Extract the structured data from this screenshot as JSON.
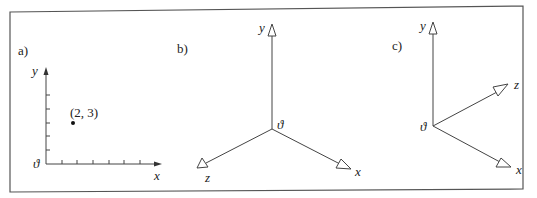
{
  "figure": {
    "border_color": "#555555",
    "panels": [
      {
        "label": "a)",
        "type": "2d-cartesian",
        "axes": {
          "x": "x",
          "y": "y",
          "origin": "ϑ"
        },
        "point": {
          "label": "(2, 3)",
          "x": 2,
          "y": 3
        },
        "x_ticks": 6,
        "y_ticks": 5
      },
      {
        "label": "b)",
        "type": "3d-axes",
        "axes": {
          "x": "x",
          "y": "y",
          "z": "z",
          "origin": "ϑ"
        }
      },
      {
        "label": "c)",
        "type": "3d-axes",
        "axes": {
          "x": "x",
          "y": "y",
          "z": "z",
          "origin": "ϑ"
        }
      }
    ]
  }
}
